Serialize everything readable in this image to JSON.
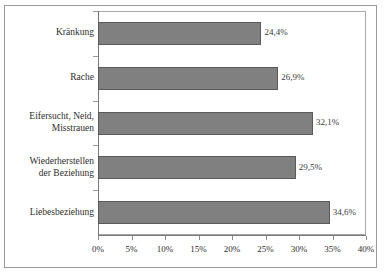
{
  "chart_data": {
    "type": "bar",
    "orientation": "horizontal",
    "title": "",
    "subtitle": "",
    "xlabel": "",
    "ylabel": "",
    "xlim": [
      0,
      40
    ],
    "grid": false,
    "legend": null,
    "series_color": "#808080",
    "categories": [
      "Kränkung",
      "Rache",
      "Eifersucht, Neid,\nMisstrauen",
      "Wiederherstellen\nder Beziehung",
      "Liebesbeziehung"
    ],
    "values": [
      24.4,
      26.9,
      32.1,
      29.5,
      34.6
    ],
    "value_labels": [
      "24,4%",
      "26,9%",
      "32,1%",
      "29,5%",
      "34,6%"
    ],
    "xticks": [
      0,
      5,
      10,
      15,
      20,
      25,
      30,
      35,
      40
    ],
    "xtick_labels": [
      "0%",
      "5%",
      "10%",
      "15%",
      "20%",
      "25%",
      "30%",
      "35%",
      "40%"
    ]
  }
}
